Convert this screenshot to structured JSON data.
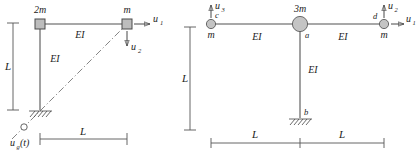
{
  "figure": {
    "colors": {
      "member": "#8a8a8a",
      "node_fill": "#c4c4c4",
      "node_stroke": "#5a5a5a",
      "dimension": "#555555",
      "arrow": "#333333",
      "dashdot": "#777777",
      "background": "#ffffff"
    }
  },
  "left_frame": {
    "name": "left-frame-diagram",
    "masses": {
      "top_left": "2m",
      "top_right": "m"
    },
    "stiffness": {
      "beam": "EI",
      "column": "EI"
    },
    "dof": {
      "horizontal": "u",
      "horizontal_sub": "1",
      "vertical": "u",
      "vertical_sub": "2"
    },
    "ground_motion": {
      "symbol": "u",
      "sub": "g",
      "arg": "(t)"
    },
    "dimensions": {
      "vertical": "L",
      "horizontal": "L"
    },
    "support": "fixed-base-hatched",
    "node_shape": "square"
  },
  "right_frame": {
    "name": "right-frame-diagram",
    "masses": {
      "left_node": "m",
      "center_node": "3m",
      "right_node": "m"
    },
    "node_labels": {
      "left": "c",
      "center": "a",
      "base": "b",
      "right": "d"
    },
    "stiffness": {
      "left_beam": "EI",
      "right_beam": "EI",
      "column": "EI"
    },
    "dof": {
      "u1": "u",
      "u1_sub": "1",
      "u2": "u",
      "u2_sub": "2",
      "u3": "u",
      "u3_sub": "3"
    },
    "dimensions": {
      "vertical": "L",
      "horizontal_left": "L",
      "horizontal_right": "L"
    },
    "support": "fixed-base-hatched",
    "node_shape": "circle"
  }
}
